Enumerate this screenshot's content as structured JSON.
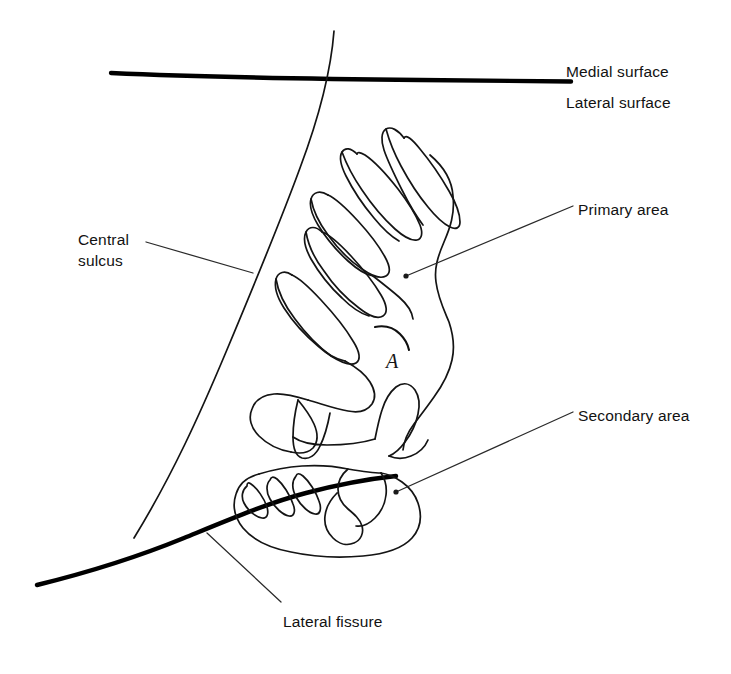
{
  "figure": {
    "background_color": "#ffffff",
    "ink_color": "#121212"
  },
  "labels": {
    "medial_surface": "Medial surface",
    "lateral_surface": "Lateral surface",
    "primary_area": "Primary area",
    "secondary_area": "Secondary area",
    "central_sulcus": "Central\nsulcus",
    "lateral_fissure": "Lateral fissure",
    "annotation_letter": "A"
  },
  "annotations": [
    {
      "name": "medial-surface",
      "text": "Medial surface",
      "x": 566,
      "y": 62,
      "leader": false
    },
    {
      "name": "lateral-surface",
      "text": "Lateral surface",
      "x": 566,
      "y": 93,
      "leader": false
    },
    {
      "name": "primary-area",
      "text": "Primary area",
      "x": 578,
      "y": 200,
      "leader": true
    },
    {
      "name": "secondary-area",
      "text": "Secondary area",
      "x": 578,
      "y": 406,
      "leader": true
    },
    {
      "name": "central-sulcus",
      "text": "Central sulcus",
      "x": 78,
      "y": 230,
      "leader": true
    },
    {
      "name": "lateral-fissure",
      "text": "Lateral fissure",
      "x": 283,
      "y": 612,
      "leader": true
    }
  ],
  "strokes": {
    "surface_divider_label": "horizontal boundary between medial and lateral surface",
    "central_sulcus_label": "long diagonal line marking the central sulcus",
    "lateral_fissure_label": "thick curved line marking the lateral fissure"
  }
}
